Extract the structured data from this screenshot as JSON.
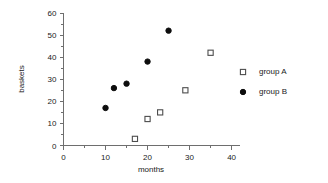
{
  "chart_data": {
    "type": "scatter",
    "title": "",
    "xlabel": "months",
    "ylabel": "baskets",
    "xlim": [
      0,
      42
    ],
    "ylim": [
      0,
      60
    ],
    "xticks": [
      0,
      10,
      20,
      30,
      40
    ],
    "yticks": [
      0,
      10,
      20,
      30,
      40,
      50,
      60
    ],
    "xminor_step": 5,
    "yminor_step": 5,
    "grid": false,
    "legend_position": "right",
    "series": [
      {
        "name": "group A",
        "marker": "open-square",
        "color": "#4d4d4d",
        "x": [
          17,
          20,
          23,
          29,
          35
        ],
        "y": [
          3,
          12,
          15,
          25,
          42
        ],
        "points": [
          {
            "x": 17,
            "y": 3
          },
          {
            "x": 20,
            "y": 12
          },
          {
            "x": 23,
            "y": 15
          },
          {
            "x": 29,
            "y": 25
          },
          {
            "x": 35,
            "y": 42
          }
        ]
      },
      {
        "name": "group B",
        "marker": "filled-circle",
        "color": "#0d0d0d",
        "x": [
          10,
          12,
          15,
          20,
          25
        ],
        "y": [
          17,
          26,
          28,
          38,
          52
        ],
        "points": [
          {
            "x": 10,
            "y": 17
          },
          {
            "x": 12,
            "y": 26
          },
          {
            "x": 15,
            "y": 28
          },
          {
            "x": 20,
            "y": 38
          },
          {
            "x": 25,
            "y": 52
          }
        ]
      }
    ]
  },
  "axis": {
    "x_label": "months",
    "y_label": "baskets",
    "x_tick_labels": [
      "0",
      "10",
      "20",
      "30",
      "40"
    ],
    "y_tick_labels": [
      "0",
      "10",
      "20",
      "30",
      "40",
      "50",
      "60"
    ]
  },
  "legend": {
    "entries": [
      {
        "label": "group A",
        "marker": "open-square"
      },
      {
        "label": "group B",
        "marker": "filled-circle"
      }
    ]
  },
  "colors": {
    "background": "#ffffff",
    "axis": "#6e6e6e",
    "text": "#1a1a1a",
    "group_a": "#4d4d4d",
    "group_b": "#0d0d0d"
  }
}
